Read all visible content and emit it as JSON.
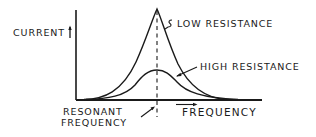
{
  "diagram": {
    "type": "resonance-curve",
    "labels": {
      "y_axis": "CURRENT",
      "x_axis": "FREQUENCY",
      "low_curve": "LOW RESISTANCE",
      "high_curve": "HIGH RESISTANCE",
      "resonant_line_1": "RESONANT",
      "resonant_line_2": "FREQUENCY"
    },
    "colors": {
      "ink": "#1a1a1a",
      "background": "#ffffff"
    },
    "curves": [
      {
        "name": "low resistance",
        "peak_relative_height": 1.0,
        "shape": "sharp peak"
      },
      {
        "name": "high resistance",
        "peak_relative_height": 0.33,
        "shape": "broad low peak"
      }
    ],
    "resonant_marker": "dashed vertical line at peak"
  }
}
